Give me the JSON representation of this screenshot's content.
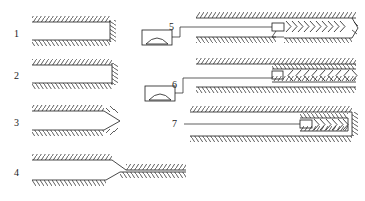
{
  "figure": {
    "type": "technical-sectional-line-drawing",
    "width": 365,
    "height": 201,
    "background_color": "#ffffff",
    "line_color": "#1a1a1a",
    "hatch_style": "short-diagonal-ticks-along-boundary"
  },
  "labels": [
    {
      "id": "1",
      "text": "1",
      "x": 14,
      "y": 29,
      "refers_to": "square-end-open-tube-with-hatched-end-face"
    },
    {
      "id": "2",
      "text": "2",
      "x": 14,
      "y": 71,
      "refers_to": "square-end-open-tube-with-plain-vertical-end"
    },
    {
      "id": "3",
      "text": "3",
      "x": 14,
      "y": 118,
      "refers_to": "tapered-pointed-end-tube"
    },
    {
      "id": "4",
      "text": "4",
      "x": 14,
      "y": 168,
      "refers_to": "stepped-offset-transition-tube"
    },
    {
      "id": "5",
      "text": "5",
      "x": 169,
      "y": 22,
      "refers_to": "tube-with-right-pointing-chevron-core-open-end"
    },
    {
      "id": "6",
      "text": "6",
      "x": 172,
      "y": 80,
      "refers_to": "tube-with-left-pointing-chevron-core-closed-band"
    },
    {
      "id": "7",
      "text": "7",
      "x": 172,
      "y": 121,
      "refers_to": "closed-capsule-with-right-pointing-chevron-core"
    }
  ],
  "items": [
    {
      "number": "1",
      "name": "item-1-square-end-tube",
      "body": {
        "x": 32,
        "y": 18,
        "width": 78,
        "height": 24
      },
      "end_face": "hatched-vertical-edge",
      "walls": [
        "top",
        "bottom"
      ]
    },
    {
      "number": "2",
      "name": "item-2-square-end-tube-plain",
      "body": {
        "x": 32,
        "y": 61,
        "width": 78,
        "height": 24
      },
      "end_face": "plain-vertical-edge-with-hatch",
      "walls": [
        "top",
        "bottom"
      ]
    },
    {
      "number": "3",
      "name": "item-3-tapered-point-tube",
      "body": {
        "x": 32,
        "y": 107,
        "width": 78,
        "height": 24
      },
      "end_face": "tapered-point",
      "walls": [
        "top",
        "bottom"
      ]
    },
    {
      "number": "4",
      "name": "item-4-stepped-offset-tube",
      "body": {
        "x": 32,
        "y": 156,
        "width": 150,
        "height": 26
      },
      "end_face": "stepped-offset-downward",
      "walls": [
        "top",
        "bottom"
      ]
    },
    {
      "number": "5",
      "name": "item-5-chevron-core-open",
      "body": {
        "x": 196,
        "y": 14,
        "width": 160,
        "height": 26
      },
      "core": {
        "direction": "right",
        "chevrons": 11
      },
      "leader": "from-symbol-5-to-core-left-end"
    },
    {
      "number": "6",
      "name": "item-6-chevron-core-banded",
      "body": {
        "x": 196,
        "y": 60,
        "width": 160,
        "height": 27
      },
      "core": {
        "direction": "left",
        "chevrons": 9
      },
      "leader": "from-symbol-6-to-core-left-end"
    },
    {
      "number": "7",
      "name": "item-7-closed-capsule-chevron-core",
      "body": {
        "x": 190,
        "y": 106,
        "width": 166,
        "height": 32
      },
      "core": {
        "direction": "right",
        "chevrons": 10
      },
      "leader": "from-label-7-to-core-left-end"
    }
  ],
  "symbols": [
    {
      "name": "arch-symbol-5",
      "shape": "rectangle-with-inner-arch",
      "x": 142,
      "y": 30,
      "width": 30,
      "height": 15,
      "linked_label": "5"
    },
    {
      "name": "arch-symbol-6",
      "shape": "rectangle-with-inner-arch",
      "x": 145,
      "y": 86,
      "width": 30,
      "height": 15,
      "linked_label": "6"
    }
  ]
}
